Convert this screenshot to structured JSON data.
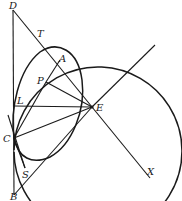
{
  "diagram": {
    "type": "geometric-construction",
    "points": [
      {
        "id": "D",
        "label": "D"
      },
      {
        "id": "T",
        "label": "T"
      },
      {
        "id": "A",
        "label": "A"
      },
      {
        "id": "P",
        "label": "P"
      },
      {
        "id": "L",
        "label": "L"
      },
      {
        "id": "E",
        "label": "E"
      },
      {
        "id": "C",
        "label": "C"
      },
      {
        "id": "S",
        "label": "S"
      },
      {
        "id": "B",
        "label": "B"
      },
      {
        "id": "X",
        "label": "X"
      }
    ],
    "segments": [
      [
        "D",
        "B"
      ],
      [
        "D",
        "E"
      ],
      [
        "P",
        "A"
      ],
      [
        "P",
        "E"
      ],
      [
        "L",
        "E"
      ],
      [
        "C",
        "E"
      ],
      [
        "C",
        "P"
      ],
      [
        "B",
        "E"
      ],
      [
        "E",
        "X"
      ],
      [
        "C",
        "S"
      ]
    ],
    "curves": [
      {
        "name": "large-circle",
        "kind": "circle"
      },
      {
        "name": "oval-curve",
        "kind": "closed-curve"
      }
    ]
  }
}
